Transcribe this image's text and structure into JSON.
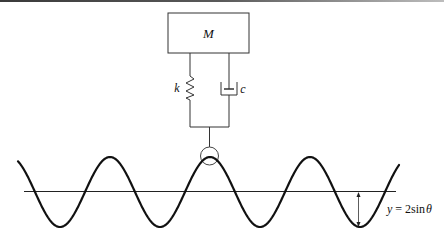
{
  "diagram": {
    "mass": {
      "label": "M"
    },
    "spring": {
      "label": "k"
    },
    "damper": {
      "label": "c"
    },
    "road": {
      "equation_prefix": "y",
      "equation_eq": " = 2sin",
      "equation_var": "θ",
      "amplitude_px": 35,
      "period_px": 100,
      "center_y_px": 192
    },
    "colors": {
      "stroke": "#111111",
      "thin_stroke": "#333333",
      "background": "#ffffff"
    }
  }
}
